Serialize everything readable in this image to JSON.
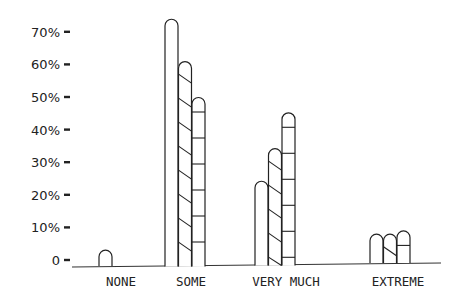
{
  "chart_data": {
    "type": "bar",
    "title": "",
    "xlabel": "",
    "ylabel": "",
    "ylim": [
      0,
      70
    ],
    "y_tick_labels": [
      "0",
      "10%",
      "20%",
      "30%",
      "40%",
      "50%",
      "60%",
      "70%"
    ],
    "y_ticks": [
      0,
      10,
      20,
      30,
      40,
      50,
      60,
      70
    ],
    "grid": false,
    "legend": null,
    "categories": [
      "NONE",
      "SOME",
      "VERY MUCH",
      "EXTREME"
    ],
    "series": [
      {
        "name": "Series 1 (plain)",
        "pattern": "none",
        "values": [
          3,
          74,
          24,
          7
        ]
      },
      {
        "name": "Series 2 (diagonal hatch)",
        "pattern": "diagonal",
        "values": [
          0,
          61,
          34,
          7
        ]
      },
      {
        "name": "Series 3 (horizontal hatch)",
        "pattern": "horizontal",
        "values": [
          0,
          50,
          45,
          8
        ]
      }
    ],
    "colors": {
      "ink": "#222222",
      "background": "#ffffff"
    }
  }
}
